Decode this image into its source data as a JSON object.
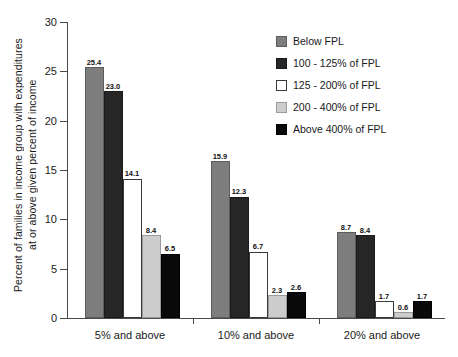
{
  "chart_data": {
    "type": "bar",
    "title": "",
    "subtitle": "",
    "xlabel": "",
    "ylabel": "Percent of families in income group with expenditures at or above given percent of income",
    "ylabel_lines": [
      "Percent of families in income group with expenditures",
      "at or above given percent of income"
    ],
    "categories": [
      "5% and above",
      "10% and above",
      "20% and above"
    ],
    "ylim": [
      0,
      30
    ],
    "yticks": [
      0,
      5,
      10,
      15,
      20,
      25,
      30
    ],
    "ytick_labels": [
      "0",
      "5",
      "10",
      "15",
      "20",
      "25",
      "30"
    ],
    "grid": false,
    "legend_position": "upper right",
    "series": [
      {
        "name": "Below FPL",
        "color": "#7d7d7d",
        "values": [
          25.4,
          15.9,
          8.7
        ],
        "labels": [
          "25.4",
          "15.9",
          "8.7"
        ]
      },
      {
        "name": "100 - 125% of FPL",
        "color": "#262626",
        "values": [
          23.0,
          12.3,
          8.4
        ],
        "labels": [
          "23.0",
          "12.3",
          "8.4"
        ]
      },
      {
        "name": "125 - 200% of FPL",
        "color": "#ffffff",
        "values": [
          14.1,
          6.7,
          1.7
        ],
        "labels": [
          "14.1",
          "6.7",
          "1.7"
        ]
      },
      {
        "name": "200 - 400% of FPL",
        "color": "#cdcdcd",
        "values": [
          8.4,
          2.3,
          0.6
        ],
        "labels": [
          "8.4",
          "2.3",
          "0.6"
        ]
      },
      {
        "name": "Above 400% of FPL",
        "color": "#090909",
        "values": [
          6.5,
          2.6,
          1.7
        ],
        "labels": [
          "6.5",
          "2.6",
          "1.7"
        ]
      }
    ]
  }
}
